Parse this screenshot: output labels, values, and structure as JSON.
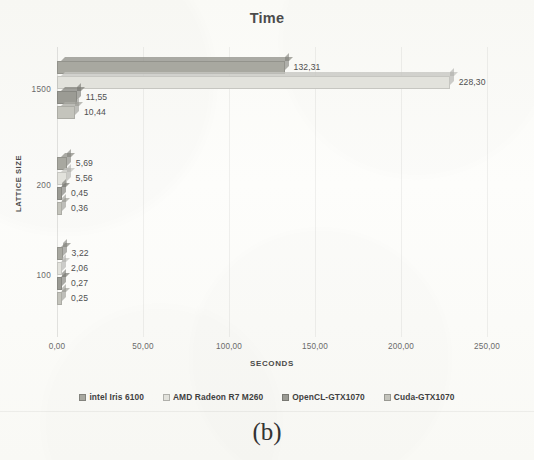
{
  "chart_data": {
    "type": "bar",
    "orientation": "horizontal",
    "title": "Time",
    "xlabel": "SECONDS",
    "ylabel": "LATTICE SIZE",
    "xlim": [
      0,
      250
    ],
    "xticks": [
      "0,00",
      "50,00",
      "100,00",
      "150,00",
      "200,00",
      "250,00"
    ],
    "xtick_values": [
      0,
      50,
      100,
      150,
      200,
      250
    ],
    "categories": [
      "1500",
      "200",
      "100"
    ],
    "grid": true,
    "legend_position": "bottom",
    "series": [
      {
        "name": "intel Iris 6100",
        "color": "#a8a8a0",
        "values": [
          132.31,
          5.69,
          3.22
        ],
        "labels": [
          "132,31",
          "5,69",
          "3,22"
        ]
      },
      {
        "name": "AMD Radeon R7 M260",
        "color": "#e2e2dc",
        "values": [
          228.3,
          5.56,
          2.06
        ],
        "labels": [
          "228,30",
          "5,56",
          "2,06"
        ]
      },
      {
        "name": "OpenCL-GTX1070",
        "color": "#9b9b94",
        "values": [
          11.55,
          0.45,
          0.27
        ],
        "labels": [
          "11,55",
          "0,45",
          "0,27"
        ]
      },
      {
        "name": "Cuda-GTX1070",
        "color": "#c4c4bc",
        "values": [
          10.44,
          0.36,
          0.25
        ],
        "labels": [
          "10,44",
          "0,36",
          "0,25"
        ]
      }
    ]
  },
  "caption": "(b)"
}
